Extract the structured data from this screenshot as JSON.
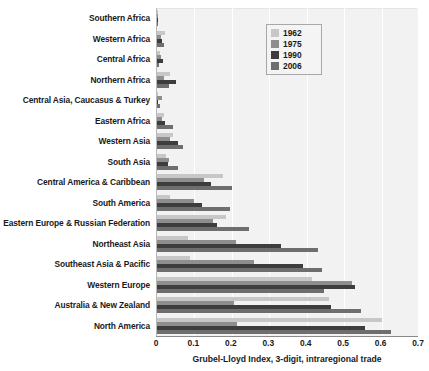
{
  "chart_data": {
    "type": "bar",
    "orientation": "horizontal",
    "title": "",
    "subtitle": "",
    "xlabel": "Grubel-Lloyd Index, 3-digit, intraregional trade",
    "ylabel": "",
    "xlim": [
      0,
      0.7
    ],
    "xticks": [
      "0",
      "0.1",
      "0.2",
      "0.3",
      "0.4",
      "0.5",
      "0.6",
      "0.7"
    ],
    "xtick_values": [
      0,
      0.1,
      0.2,
      0.3,
      0.4,
      0.5,
      0.6,
      0.7
    ],
    "grid": "vertical",
    "legend_position": "top-right-inside",
    "legend": [
      "1962",
      "1975",
      "1990",
      "2006"
    ],
    "series_colors": [
      "#c7c7c7",
      "#8e8e8e",
      "#3d3d3d",
      "#6e6e6e"
    ],
    "categories": [
      "Southern Africa",
      "Western Africa",
      "Central Africa",
      "Northern Africa",
      "Central Asia, Caucasus & Turkey",
      "Eastern Africa",
      "Western Asia",
      "South Asia",
      "Central America & Caribbean",
      "South America",
      "Eastern Europe & Russian Federation",
      "Northeast Asia",
      "Southeast Asia & Pacific",
      "Western Europe",
      "Australia & New Zealand",
      "North America"
    ],
    "series": [
      {
        "name": "1962",
        "values": [
          0.004,
          0.022,
          0.007,
          0.035,
          0.0,
          0.018,
          0.043,
          0.024,
          0.175,
          0.035,
          0.185,
          0.082,
          0.088,
          0.415,
          0.46,
          0.6
        ]
      },
      {
        "name": "1975",
        "values": [
          0.004,
          0.01,
          0.012,
          0.02,
          0.014,
          0.013,
          0.035,
          0.033,
          0.125,
          0.1,
          0.15,
          0.21,
          0.26,
          0.52,
          0.205,
          0.215
        ]
      },
      {
        "name": "1990",
        "values": [
          0.003,
          0.014,
          0.015,
          0.05,
          0.0,
          0.022,
          0.055,
          0.03,
          0.145,
          0.12,
          0.16,
          0.33,
          0.39,
          0.53,
          0.465,
          0.555
        ]
      },
      {
        "name": "2006",
        "values": [
          0.003,
          0.02,
          0.006,
          0.032,
          0.008,
          0.042,
          0.07,
          0.055,
          0.2,
          0.195,
          0.245,
          0.43,
          0.44,
          0.445,
          0.545,
          0.625
        ]
      }
    ]
  }
}
